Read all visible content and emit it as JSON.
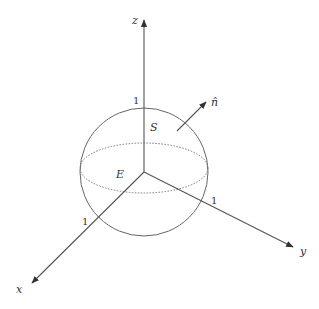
{
  "diagram": {
    "axes": {
      "x": {
        "label": "x",
        "tick_label": "1"
      },
      "y": {
        "label": "y",
        "tick_label": "1"
      },
      "z": {
        "label": "z",
        "tick_label": "1"
      }
    },
    "surface_label": "S",
    "region_label": "E",
    "normal_label": "n̂",
    "colors": {
      "stroke": "#555555",
      "text": "#333333",
      "background": "#ffffff"
    }
  }
}
